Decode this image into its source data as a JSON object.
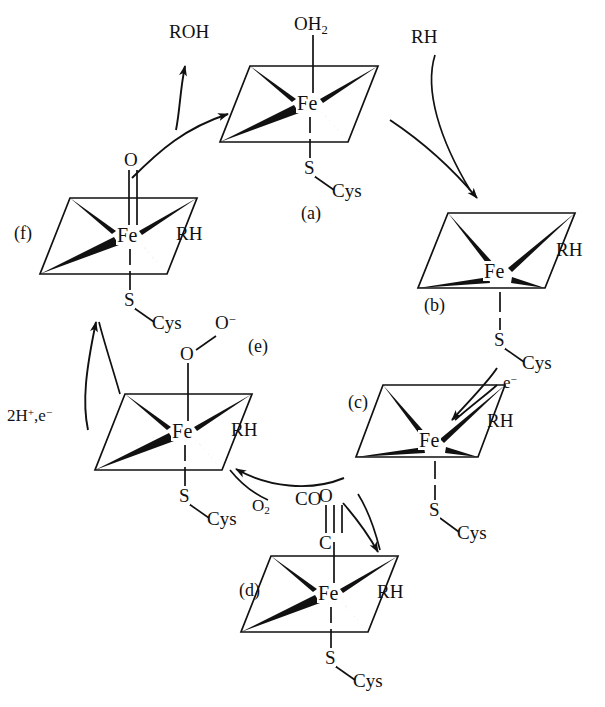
{
  "diagram": {
    "type": "reaction-cycle",
    "direction": "clockwise",
    "ink_color": "#111111",
    "background_color": "#ffffff"
  },
  "metal_center_label": "Fe",
  "structures": [
    {
      "id": "a",
      "tag": "(a)",
      "metal": "Fe",
      "axial_top": "OH2",
      "axial_top_html": "OH<sub>2</sub>",
      "axial_top_bond": "single",
      "axial_bottom_atom": "S",
      "axial_bottom_group": "Cys",
      "side_ligand": "",
      "fe_position": "center"
    },
    {
      "id": "b",
      "tag": "(b)",
      "metal": "Fe",
      "axial_top": "",
      "axial_top_html": "",
      "axial_top_bond": "none",
      "axial_bottom_atom": "S",
      "axial_bottom_group": "Cys",
      "side_ligand": "RH",
      "fe_position": "low"
    },
    {
      "id": "c",
      "tag": "(c)",
      "metal": "Fe",
      "axial_top": "",
      "axial_top_html": "",
      "axial_top_bond": "none",
      "axial_bottom_atom": "S",
      "axial_bottom_group": "Cys",
      "side_ligand": "RH",
      "fe_position": "low"
    },
    {
      "id": "d",
      "tag": "(d)",
      "metal": "Fe",
      "axial_top": "C",
      "axial_top_html": "C",
      "axial_top_second": "O",
      "axial_top_bond": "triple",
      "axial_bottom_atom": "S",
      "axial_bottom_group": "Cys",
      "side_ligand": "RH",
      "fe_position": "center"
    },
    {
      "id": "e",
      "tag": "(e)",
      "metal": "Fe",
      "axial_top": "O",
      "axial_top_html": "O",
      "axial_top_second": "O−",
      "axial_top_second_html": "O<sup>−</sup>",
      "axial_top_bond": "single-bent",
      "axial_bottom_atom": "S",
      "axial_bottom_group": "Cys",
      "side_ligand": "RH",
      "fe_position": "center"
    },
    {
      "id": "f",
      "tag": "(f)",
      "metal": "Fe",
      "axial_top": "O",
      "axial_top_html": "O",
      "axial_top_bond": "double",
      "axial_bottom_atom": "S",
      "axial_bottom_group": "Cys",
      "side_ligand": "RH",
      "fe_position": "center"
    }
  ],
  "reagents": {
    "product_roh": "ROH",
    "substrate_rh_in": "RH",
    "electron_in": "e−",
    "electron_in_html": "e<sup>−</sup>",
    "dioxygen_in": "O2",
    "dioxygen_in_html": "O<sub>2</sub>",
    "carbon_monoxide_in": "CO",
    "protons_electron_in": "2H+,e−",
    "protons_electron_in_html": "2H<sup>+</sup>,e<sup>−</sup>"
  },
  "ligand_labels": {
    "rh_b": "RH",
    "rh_c": "RH",
    "rh_d": "RH",
    "rh_e": "RH",
    "rh_f": "RH",
    "cys_a": "Cys",
    "cys_b": "Cys",
    "cys_c": "Cys",
    "cys_d": "Cys",
    "cys_e": "Cys",
    "cys_f": "Cys",
    "s_a": "S",
    "s_b": "S",
    "s_c": "S",
    "s_d": "S",
    "s_e": "S",
    "s_f": "S",
    "o_f": "O",
    "o_e_inner": "O",
    "o_e_outer": "O−",
    "o_d": "O",
    "c_d": "C",
    "oh2_a": "OH2"
  },
  "tags": {
    "a": "(a)",
    "b": "(b)",
    "c": "(c)",
    "d": "(d)",
    "e": "(e)",
    "f": "(f)"
  }
}
